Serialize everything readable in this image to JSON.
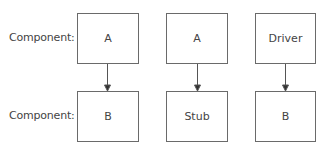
{
  "diagram": {
    "row_labels": [
      "Component:",
      "Component:"
    ],
    "columns": [
      {
        "top": "A",
        "bottom": "B"
      },
      {
        "top": "A",
        "bottom": "Stub"
      },
      {
        "top": "Driver",
        "bottom": "B"
      }
    ],
    "colors": {
      "stroke": "#6a6a6a",
      "text": "#444444",
      "background": "#ffffff"
    }
  }
}
